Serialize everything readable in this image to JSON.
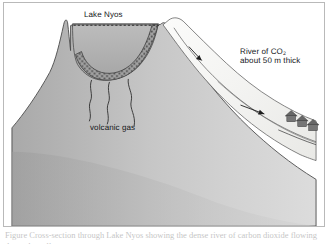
{
  "figure": {
    "caption": "Figure  Cross-section through Lake Nyos showing the dense river of carbon dioxide flowing down the valley."
  },
  "labels": {
    "lake": "Lake Nyos",
    "river_line1": "River of CO",
    "river_sub": "2",
    "river_line2": "about 50 m thick",
    "volcanic_gas": "volcanic gas"
  },
  "colors": {
    "mountain_light": "#d6d6d6",
    "mountain_dark": "#9d9d9d",
    "lake_water": "#b3b3b3",
    "gas_layer": "#8e8e8e",
    "co2_river": "#f4f4f2",
    "outline": "#3b3b3b",
    "house": "#6e6e6e",
    "frame": "#b9b9b9",
    "text": "#14161a"
  },
  "scene": {
    "elements": [
      {
        "name": "mountain-mass",
        "kind": "terrain"
      },
      {
        "name": "lake-water",
        "kind": "water"
      },
      {
        "name": "gas-saturated-layer",
        "kind": "stippled-layer"
      },
      {
        "name": "lake-surface-dashed-line",
        "kind": "guide"
      },
      {
        "name": "co2-river",
        "kind": "flow"
      },
      {
        "name": "flow-arrow-upper",
        "kind": "arrow"
      },
      {
        "name": "flow-arrow-lower",
        "kind": "arrow"
      },
      {
        "name": "gas-vent-conduits",
        "kind": "conduits",
        "count": 3
      },
      {
        "name": "village-houses",
        "kind": "buildings",
        "count": 3
      }
    ]
  }
}
